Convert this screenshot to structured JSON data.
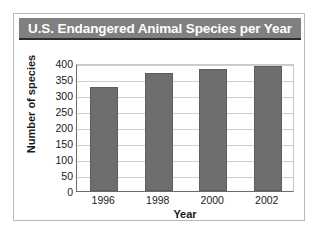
{
  "card": {
    "title": "U.S. Endangered Animal Species per Year",
    "title_bar_color": "#808080",
    "title_text_color": "#ffffff",
    "border_color": "#b8b8b8"
  },
  "chart_data": {
    "type": "bar",
    "title": "U.S. Endangered Animal Species per Year",
    "categories": [
      "1996",
      "1998",
      "2000",
      "2002"
    ],
    "values": [
      325,
      370,
      382,
      390
    ],
    "xlabel": "Year",
    "ylabel": "Number of species",
    "ylim": [
      0,
      400
    ],
    "yticks": [
      0,
      50,
      100,
      150,
      200,
      250,
      300,
      350,
      400
    ],
    "ytick_labels": [
      "0",
      "50",
      "100",
      "150",
      "200",
      "250",
      "300",
      "350",
      "400"
    ],
    "grid": true,
    "legend": "none",
    "bar_color": "#6e6e6e",
    "gridline_color": "#cfcfcf",
    "axis_color": "#6b6b6b"
  }
}
